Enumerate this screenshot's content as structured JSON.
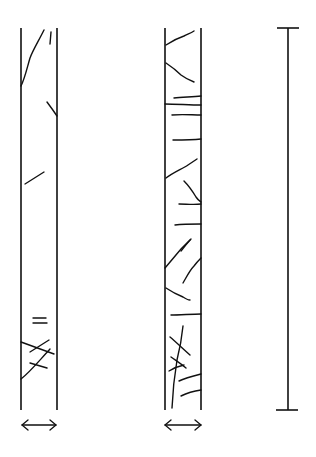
{
  "diagram": {
    "type": "core-column-comparison",
    "columns": [
      {
        "id": "column-left",
        "label": "",
        "x_left": 21,
        "x_right": 57,
        "y_top": 28,
        "y_bottom": 410,
        "fracture_count": 9,
        "width_indicator": "double-headed-arrow"
      },
      {
        "id": "column-right",
        "label": "",
        "x_left": 165,
        "x_right": 201,
        "y_top": 28,
        "y_bottom": 410,
        "fracture_count": 22,
        "width_indicator": "double-headed-arrow"
      }
    ],
    "scale_bar": {
      "x": 288,
      "y_top": 28,
      "y_bottom": 410,
      "label": ""
    },
    "colors": {
      "line": "#111111",
      "background": "#ffffff"
    }
  }
}
